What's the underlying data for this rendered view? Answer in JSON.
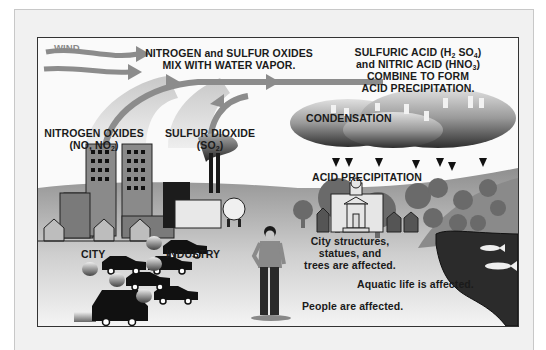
{
  "diagram": {
    "labels": {
      "wind": "WIND",
      "mix_line1": "NITROGEN and SULFUR OXIDES",
      "mix_line2": "MIX WITH WATER VAPOR.",
      "acid_line1_a": "SULFURIC ACID (H",
      "acid_line1_sub1": "2",
      "acid_line1_b": " SO",
      "acid_line1_sub2": "4",
      "acid_line1_c": ")",
      "acid_line2_a": "and NITRIC ACID (HNO",
      "acid_line2_sub": "3",
      "acid_line2_b": ")",
      "acid_line3": "COMBINE TO FORM",
      "acid_line4": "ACID PRECIPITATION.",
      "condensation": "CONDENSATION",
      "acid_precipitation": "ACID PRECIPITATION",
      "nox_line1": "NITROGEN OXIDES",
      "nox_line2_a": "(NO, NO",
      "nox_line2_sub": "2",
      "nox_line2_b": ")",
      "so2_line1": "SULFUR DIOXIDE",
      "so2_line2_a": "(SO",
      "so2_line2_sub": "2",
      "so2_line2_b": ")",
      "city": "CITY",
      "industry": "INDUSTRY",
      "structures_line1": "City structures,",
      "structures_line2": "statues, and",
      "structures_line3": "trees are affected.",
      "aquatic": "Aquatic life is affected.",
      "people": "People are affected."
    },
    "colors": {
      "arrow_gray": "#8c8c8c",
      "sky": "#fafafa",
      "ground": "#9a9a9a",
      "building_dark": "#555555",
      "water": "#2b2b2b",
      "cloud_dark": "#3a3a3a"
    }
  }
}
